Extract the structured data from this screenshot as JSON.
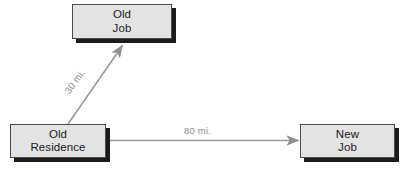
{
  "diagram": {
    "background_color": "#ffffff",
    "node_fill": "#e3e3e3",
    "node_border": "#4a4a4a",
    "node_shadow": "#1b1b1b",
    "edge_color": "#9a9a9a",
    "label_color": "#8a8a8a",
    "nodes": [
      {
        "id": "old-job",
        "line1": "Old",
        "line2": "Job"
      },
      {
        "id": "old-residence",
        "line1": "Old",
        "line2": "Residence"
      },
      {
        "id": "new-job",
        "line1": "New",
        "line2": "Job"
      }
    ],
    "edges": [
      {
        "id": "residence-to-old-job",
        "from": "old-residence",
        "to": "old-job",
        "label": "30 mi.",
        "distance_value": 30,
        "distance_unit": "mi."
      },
      {
        "id": "residence-to-new-job",
        "from": "old-residence",
        "to": "new-job",
        "label": "80 mi.",
        "distance_value": 80,
        "distance_unit": "mi."
      }
    ]
  }
}
